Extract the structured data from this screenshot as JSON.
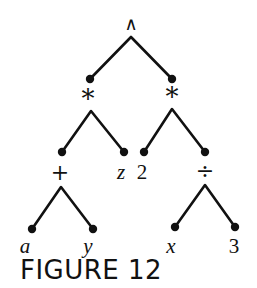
{
  "caption": "FIGURE 12",
  "tree": {
    "root": {
      "label": "∧",
      "x": 131,
      "y": 24
    },
    "nodes": [
      {
        "id": "mul-left",
        "label": "*",
        "x": 88,
        "y": 98
      },
      {
        "id": "mul-right",
        "label": "*",
        "x": 172,
        "y": 96
      },
      {
        "id": "plus",
        "label": "+",
        "x": 60,
        "y": 173
      },
      {
        "id": "z",
        "label": "z",
        "x": 121,
        "y": 172
      },
      {
        "id": "two",
        "label": "2",
        "x": 142,
        "y": 172
      },
      {
        "id": "div",
        "label": "÷",
        "x": 205,
        "y": 172
      },
      {
        "id": "a",
        "label": "a",
        "x": 25,
        "y": 246
      },
      {
        "id": "y",
        "label": "y",
        "x": 88,
        "y": 246
      },
      {
        "id": "x",
        "label": "x",
        "x": 171,
        "y": 246
      },
      {
        "id": "three",
        "label": "3",
        "x": 234,
        "y": 246
      }
    ]
  },
  "colors": {
    "ink": "#111111",
    "background": "#ffffff"
  }
}
